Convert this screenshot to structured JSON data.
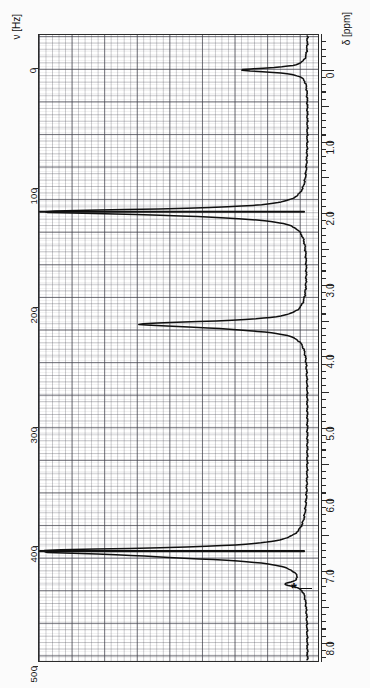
{
  "figure": {
    "kind": "nmr-spectrum",
    "orientation": "rotated-90",
    "left_axis_title": "ν [Hz]",
    "right_axis_title": "δ [ppm]",
    "annotation_marker": "*",
    "background_color": "#ffffff",
    "trace_color": "#101010",
    "grid_color": "#3c3c46"
  },
  "hz_axis": {
    "unit": "Hz",
    "ticks": [
      "0",
      "100",
      "200",
      "300",
      "400",
      "500"
    ],
    "values": [
      0,
      100,
      200,
      300,
      400,
      500
    ],
    "min": 0,
    "max": 500
  },
  "ppm_axis": {
    "unit": "ppm",
    "ticks": [
      "0",
      "1.0",
      "2.0",
      "3.0",
      "4.0",
      "5.0",
      "6.0",
      "7.0",
      "8.0"
    ],
    "values": [
      0,
      1.0,
      2.0,
      3.0,
      4.0,
      5.0,
      6.0,
      7.0,
      8.0
    ],
    "min": -0.5,
    "max": 8.3
  },
  "chart_data": {
    "type": "line",
    "title": "",
    "xlabel": "δ [ppm]",
    "ylabel": "intensity",
    "xlim": [
      -0.5,
      8.3
    ],
    "ylim": [
      0,
      1
    ],
    "grid": true,
    "legend": null,
    "series": [
      {
        "name": "1H NMR trace",
        "peaks": [
          {
            "ppm": 0.0,
            "hz": 0,
            "label": "TMS",
            "rel_height": 0.26,
            "width_ppm": 0.035
          },
          {
            "ppm": 1.98,
            "hz": 119,
            "label": "",
            "rel_height": 1.0,
            "width_ppm": 0.045
          },
          {
            "ppm": 2.05,
            "hz": 123,
            "label": "",
            "rel_height": 0.12,
            "width_ppm": 0.05
          },
          {
            "ppm": 3.55,
            "hz": 213,
            "label": "",
            "rel_height": 0.62,
            "width_ppm": 0.05
          },
          {
            "ppm": 3.62,
            "hz": 217,
            "label": "",
            "rel_height": 0.1,
            "width_ppm": 0.05
          },
          {
            "ppm": 6.72,
            "hz": 403,
            "label": "",
            "rel_height": 1.0,
            "width_ppm": 0.05
          },
          {
            "ppm": 6.8,
            "hz": 408,
            "label": "",
            "rel_height": 0.3,
            "width_ppm": 0.06
          },
          {
            "ppm": 7.18,
            "hz": 431,
            "label": "*",
            "rel_height": 0.07,
            "width_ppm": 0.04
          }
        ]
      }
    ],
    "annotations": [
      {
        "text": "*",
        "ppm": 7.18,
        "note": "marked minor signal"
      }
    ]
  }
}
